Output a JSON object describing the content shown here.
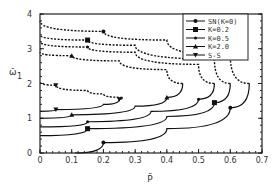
{
  "chart_data": {
    "type": "line",
    "title": "",
    "xlabel": "P̄",
    "ylabel": "ω̄₁",
    "xlim": [
      0,
      0.7
    ],
    "ylim": [
      0,
      4
    ],
    "xticks": [
      "0",
      "0.1",
      "0.2",
      "0.3",
      "0.4",
      "0.5",
      "0.6",
      "0.7"
    ],
    "yticks": [
      "0",
      "1",
      "2",
      "3",
      "4"
    ],
    "legend_position": "top-right",
    "grid": false,
    "series": [
      {
        "name": "SN(K=0)",
        "marker": "circle",
        "lower": [
          [
            0.11,
            0
          ],
          [
            0.2,
            0.3
          ],
          [
            0.4,
            0.7
          ],
          [
            0.6,
            1.3
          ],
          [
            0.66,
            2.0
          ]
        ],
        "upper": [
          [
            0.66,
            2.0
          ],
          [
            0.6,
            2.8
          ],
          [
            0.4,
            3.25
          ],
          [
            0.2,
            3.5
          ],
          [
            0,
            3.8
          ]
        ]
      },
      {
        "name": "K=0.2",
        "marker": "square",
        "lower": [
          [
            0,
            0.5
          ],
          [
            0.15,
            0.7
          ],
          [
            0.4,
            1.05
          ],
          [
            0.55,
            1.45
          ],
          [
            0.6,
            2.0
          ]
        ],
        "upper": [
          [
            0.6,
            2.0
          ],
          [
            0.55,
            2.7
          ],
          [
            0.3,
            3.1
          ],
          [
            0.15,
            3.25
          ],
          [
            0,
            3.4
          ]
        ]
      },
      {
        "name": "K=0.5",
        "marker": "diamond",
        "lower": [
          [
            0,
            0.75
          ],
          [
            0.15,
            0.9
          ],
          [
            0.35,
            1.2
          ],
          [
            0.5,
            1.55
          ],
          [
            0.55,
            2.0
          ]
        ],
        "upper": [
          [
            0.55,
            2.0
          ],
          [
            0.5,
            2.55
          ],
          [
            0.3,
            2.9
          ],
          [
            0.15,
            3.05
          ],
          [
            0,
            3.2
          ]
        ]
      },
      {
        "name": "K=2.0",
        "marker": "triangle",
        "lower": [
          [
            0,
            1.0
          ],
          [
            0.1,
            1.1
          ],
          [
            0.3,
            1.35
          ],
          [
            0.4,
            1.6
          ],
          [
            0.45,
            2.0
          ]
        ],
        "upper": [
          [
            0.45,
            2.0
          ],
          [
            0.4,
            2.4
          ],
          [
            0.25,
            2.65
          ],
          [
            0.1,
            2.8
          ],
          [
            0,
            2.9
          ]
        ]
      },
      {
        "name": "S-S",
        "marker": "triangle-down",
        "lower": [
          [
            0,
            1.2
          ],
          [
            0.05,
            1.25
          ],
          [
            0.2,
            1.4
          ],
          [
            0.25,
            1.55
          ],
          [
            0.26,
            1.6
          ]
        ],
        "upper": [
          [
            0.26,
            1.6
          ],
          [
            0.2,
            1.7
          ],
          [
            0.15,
            1.8
          ],
          [
            0.05,
            1.95
          ],
          [
            0,
            2.05
          ]
        ]
      }
    ]
  },
  "legend": [
    "SN(K=0)",
    "K=0.2",
    "K=0.5",
    "K=2.0",
    "S-S"
  ],
  "axis": {
    "xlabel": "P̄",
    "ylabel": "ω̄",
    "ylabel_sub": "1"
  }
}
